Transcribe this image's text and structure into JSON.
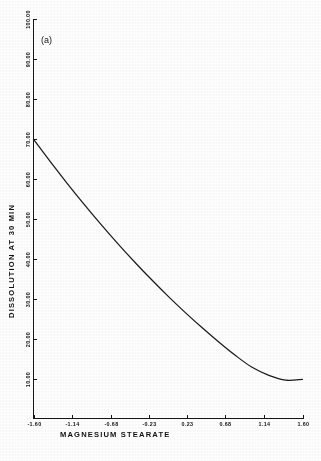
{
  "figure": {
    "panel_label": "(a)",
    "background_color": "#ffffff",
    "line_color": "#1b1b1b",
    "axis_color": "#151515"
  },
  "chart_data": {
    "type": "line",
    "title": "",
    "subtitle": "",
    "panel": "(a)",
    "xlabel": "MAGNESIUM STEARATE",
    "ylabel": "DISSOLUTION AT 30 MIN",
    "xlim": [
      -1.6,
      1.6
    ],
    "ylim": [
      0.0,
      100.0
    ],
    "grid": false,
    "legend": null,
    "legend_position": "none",
    "xticks": [
      -1.6,
      -1.14,
      -0.68,
      -0.23,
      0.23,
      0.68,
      1.14,
      1.6
    ],
    "xticklabels": [
      "-1.60",
      "-1.14",
      "-0.68",
      "-0.23",
      "0.23",
      "0.68",
      "1.14",
      "1.60"
    ],
    "yticks": [
      10.0,
      20.0,
      30.0,
      40.0,
      50.0,
      60.0,
      70.0,
      80.0,
      90.0,
      100.0
    ],
    "yticklabels": [
      "10.00",
      "20.00",
      "30.00",
      "40.00",
      "50.00",
      "60.00",
      "70.00",
      "80.00",
      "90.00",
      "100.00"
    ],
    "series": [
      {
        "name": "dissolution",
        "x": [
          -1.6,
          -1.4,
          -1.2,
          -1.0,
          -0.8,
          -0.6,
          -0.4,
          -0.2,
          0.0,
          0.2,
          0.4,
          0.6,
          0.8,
          1.0,
          1.2,
          1.4,
          1.6
        ],
        "y": [
          69.8,
          64.2,
          58.8,
          53.6,
          48.6,
          43.8,
          39.2,
          34.8,
          30.6,
          26.6,
          22.8,
          19.2,
          15.8,
          12.8,
          10.8,
          9.6,
          9.8
        ]
      }
    ]
  },
  "axes": {
    "x_axis_title": "MAGNESIUM STEARATE",
    "y_axis_title": "DISSOLUTION AT 30 MIN"
  }
}
